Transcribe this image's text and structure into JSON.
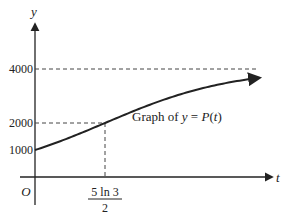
{
  "chart_data": {
    "type": "line",
    "title": "",
    "xlabel": "t",
    "ylabel": "y",
    "origin_label": "O",
    "curve_label": "Graph of y = P(t)",
    "curve_label_parts": {
      "prefix": "Graph of ",
      "y": "y",
      "eq": " = ",
      "P": "P",
      "open": "(",
      "t": "t",
      "close": ")"
    },
    "y_ticks": [
      {
        "value": 1000,
        "label": "1000"
      },
      {
        "value": 2000,
        "label": "2000"
      },
      {
        "value": 4000,
        "label": "4000"
      }
    ],
    "x_ticks": [
      {
        "value": 2.7465,
        "label_numerator": "5 ln 3",
        "label_denominator": "2"
      }
    ],
    "asymptote": {
      "y": 4000,
      "style": "dashed"
    },
    "reference_point": {
      "x": 2.7465,
      "y": 2000
    },
    "series": [
      {
        "name": "P(t)",
        "model": "logistic",
        "params": {
          "L": 4000,
          "P0": 1000,
          "k": 0.4
        },
        "x_range": [
          0,
          8.8
        ]
      }
    ],
    "xlim": [
      0,
      10.2
    ],
    "ylim": [
      0,
      4700
    ],
    "grid": false,
    "legend": "none"
  }
}
